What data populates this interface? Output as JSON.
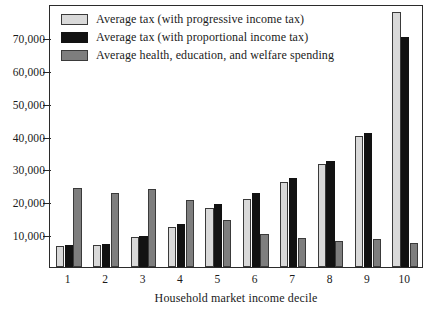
{
  "chart_data": {
    "type": "bar",
    "title": "",
    "xlabel": "Household market income decile",
    "ylabel": "",
    "categories": [
      "1",
      "2",
      "3",
      "4",
      "5",
      "6",
      "7",
      "8",
      "9",
      "10"
    ],
    "series": [
      {
        "name": "Average tax (with progressive income tax)",
        "color": "#d9d9d9",
        "values": [
          6300,
          6700,
          9000,
          12200,
          18000,
          20800,
          25800,
          31200,
          40000,
          77500
        ]
      },
      {
        "name": "Average tax (with proportional income tax)",
        "color": "#121212",
        "values": [
          6600,
          7100,
          9300,
          13000,
          19300,
          22600,
          27200,
          32200,
          40800,
          70000
        ]
      },
      {
        "name": "Average health, education, and welfare spending",
        "color": "#7e7e7e",
        "values": [
          24000,
          22400,
          23600,
          20400,
          14400,
          10000,
          8800,
          7800,
          8500,
          7400
        ]
      }
    ],
    "yticks": [
      10000,
      20000,
      30000,
      40000,
      50000,
      60000,
      70000
    ],
    "ytick_labels": [
      "10,000",
      "20,000",
      "30,000",
      "40,000",
      "50,000",
      "60,000",
      "70,000"
    ],
    "ylim": [
      0,
      80000
    ],
    "grid": false,
    "legend_position": "top-left-inside"
  }
}
